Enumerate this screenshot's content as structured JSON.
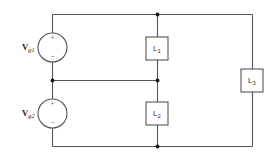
{
  "diagram": {
    "type": "circuit",
    "colors": {
      "wire": "#555555",
      "node": "#1a1a1a",
      "text": "#333333",
      "background": "#ffffff"
    },
    "sources": [
      {
        "id": "vg1",
        "label_main": "V",
        "label_sub": "g1",
        "plus": "+",
        "minus": "−"
      },
      {
        "id": "vg2",
        "label_main": "V",
        "label_sub": "g2",
        "plus": "+",
        "minus": "−"
      }
    ],
    "loads": [
      {
        "id": "l1",
        "label_main": "L",
        "label_sub": "1"
      },
      {
        "id": "l2",
        "label_main": "L",
        "label_sub": "2"
      },
      {
        "id": "l3",
        "label_main": "L",
        "label_sub": "3"
      }
    ],
    "nodes": [
      "top-node",
      "middle-node",
      "bottom-node"
    ]
  }
}
